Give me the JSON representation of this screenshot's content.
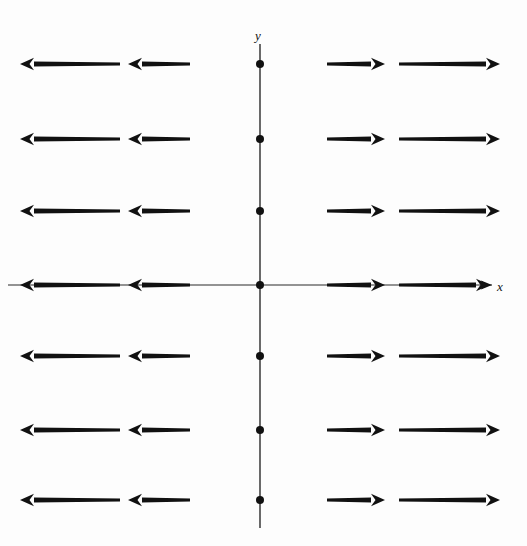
{
  "figure": {
    "kind": "vector-field-diagram",
    "background_color": "#fdfdfd",
    "ink_color": "#111111",
    "axis_color": "#2a2a2a",
    "width": 527,
    "height": 546
  },
  "axes": {
    "x_label": "x",
    "y_label": "y",
    "origin": {
      "x": 260,
      "y": 285
    },
    "x_axis": {
      "x1": 8,
      "y1": 285,
      "x2": 492,
      "y2": 285,
      "stroke_width": 1.1
    },
    "y_axis": {
      "x1": 260,
      "y1": 44,
      "x2": 260,
      "y2": 528,
      "stroke_width": 1.4
    }
  },
  "chart_data": {
    "type": "scatter",
    "title": "",
    "xlabel": "x",
    "ylabel": "y",
    "grid": false,
    "legend": null,
    "axis_dots": {
      "label": "dots marking lattice points on the y-axis",
      "radius": 4,
      "x": 260,
      "y_values": [
        64,
        139,
        211,
        285,
        356,
        430,
        500
      ]
    },
    "rows": [
      {
        "row": 1,
        "y": 64
      },
      {
        "row": 2,
        "y": 139
      },
      {
        "row": 3,
        "y": 211
      },
      {
        "row": 4,
        "y": 285
      },
      {
        "row": 5,
        "y": 356
      },
      {
        "row": 6,
        "y": 430
      },
      {
        "row": 7,
        "y": 500
      }
    ],
    "arrows": [
      {
        "row": 1,
        "y": 64,
        "x_start": 120,
        "x_end": 20,
        "direction": "left",
        "length": 100
      },
      {
        "row": 1,
        "y": 64,
        "x_start": 190,
        "x_end": 128,
        "direction": "left",
        "length": 62
      },
      {
        "row": 1,
        "y": 64,
        "x_start": 327,
        "x_end": 385,
        "direction": "right",
        "length": 58
      },
      {
        "row": 1,
        "y": 64,
        "x_start": 399,
        "x_end": 500,
        "direction": "right",
        "length": 101
      },
      {
        "row": 2,
        "y": 139,
        "x_start": 120,
        "x_end": 20,
        "direction": "left",
        "length": 100
      },
      {
        "row": 2,
        "y": 139,
        "x_start": 190,
        "x_end": 128,
        "direction": "left",
        "length": 62
      },
      {
        "row": 2,
        "y": 139,
        "x_start": 327,
        "x_end": 385,
        "direction": "right",
        "length": 58
      },
      {
        "row": 2,
        "y": 139,
        "x_start": 399,
        "x_end": 500,
        "direction": "right",
        "length": 101
      },
      {
        "row": 3,
        "y": 211,
        "x_start": 120,
        "x_end": 20,
        "direction": "left",
        "length": 100
      },
      {
        "row": 3,
        "y": 211,
        "x_start": 190,
        "x_end": 128,
        "direction": "left",
        "length": 62
      },
      {
        "row": 3,
        "y": 211,
        "x_start": 327,
        "x_end": 385,
        "direction": "right",
        "length": 58
      },
      {
        "row": 3,
        "y": 211,
        "x_start": 399,
        "x_end": 500,
        "direction": "right",
        "length": 101
      },
      {
        "row": 4,
        "y": 285,
        "x_start": 120,
        "x_end": 20,
        "direction": "left",
        "length": 100
      },
      {
        "row": 4,
        "y": 285,
        "x_start": 190,
        "x_end": 128,
        "direction": "left",
        "length": 62
      },
      {
        "row": 4,
        "y": 285,
        "x_start": 327,
        "x_end": 385,
        "direction": "right",
        "length": 58
      },
      {
        "row": 4,
        "y": 285,
        "x_start": 399,
        "x_end": 490,
        "direction": "right",
        "length": 91
      },
      {
        "row": 5,
        "y": 356,
        "x_start": 120,
        "x_end": 20,
        "direction": "left",
        "length": 100
      },
      {
        "row": 5,
        "y": 356,
        "x_start": 190,
        "x_end": 128,
        "direction": "left",
        "length": 62
      },
      {
        "row": 5,
        "y": 356,
        "x_start": 327,
        "x_end": 385,
        "direction": "right",
        "length": 58
      },
      {
        "row": 5,
        "y": 356,
        "x_start": 399,
        "x_end": 500,
        "direction": "right",
        "length": 101
      },
      {
        "row": 6,
        "y": 430,
        "x_start": 120,
        "x_end": 20,
        "direction": "left",
        "length": 100
      },
      {
        "row": 6,
        "y": 430,
        "x_start": 190,
        "x_end": 128,
        "direction": "left",
        "length": 62
      },
      {
        "row": 6,
        "y": 430,
        "x_start": 327,
        "x_end": 385,
        "direction": "right",
        "length": 58
      },
      {
        "row": 6,
        "y": 430,
        "x_start": 399,
        "x_end": 500,
        "direction": "right",
        "length": 101
      },
      {
        "row": 7,
        "y": 500,
        "x_start": 120,
        "x_end": 20,
        "direction": "left",
        "length": 100
      },
      {
        "row": 7,
        "y": 500,
        "x_start": 190,
        "x_end": 128,
        "direction": "left",
        "length": 62
      },
      {
        "row": 7,
        "y": 500,
        "x_start": 327,
        "x_end": 385,
        "direction": "right",
        "length": 58
      },
      {
        "row": 7,
        "y": 500,
        "x_start": 399,
        "x_end": 500,
        "direction": "right",
        "length": 101
      }
    ]
  }
}
